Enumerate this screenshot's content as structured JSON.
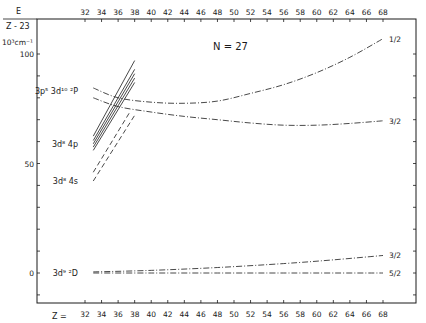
{
  "chart_data": {
    "type": "line",
    "title": "N = 27",
    "ylabel_top": "E",
    "ylabel_bottom": "Z - 23",
    "yunit": "10³cm⁻¹",
    "xlabel": "Z =",
    "xlim": [
      32,
      68
    ],
    "ylim": [
      -13,
      107
    ],
    "x_ticks": [
      32,
      34,
      36,
      38,
      40,
      42,
      44,
      46,
      48,
      50,
      52,
      54,
      56,
      58,
      60,
      62,
      64,
      66,
      68
    ],
    "y_ticks_labeled": [
      0,
      50,
      100
    ],
    "y_minor_step": 10,
    "grid": false,
    "group_labels": [
      {
        "text": "3p⁵ 3d¹⁰ ²P",
        "E": 83
      },
      {
        "text": "3d⁸ 4p",
        "E": 59
      },
      {
        "text": "3d⁸ 4s",
        "E": 42
      },
      {
        "text": "3d⁹ ²D",
        "E": 0
      }
    ],
    "series": [
      {
        "name": "3p5 3d10 2P 1/2",
        "end_label": "1/2",
        "style": "dashdot",
        "x": [
          33,
          36,
          40,
          44,
          48,
          52,
          56,
          60,
          64,
          68
        ],
        "y": [
          84.5,
          80,
          78,
          77.5,
          78.5,
          82,
          86,
          91.5,
          98.5,
          107
        ]
      },
      {
        "name": "3p5 3d10 2P 3/2",
        "end_label": "3/2",
        "style": "dashdot",
        "x": [
          33,
          36,
          40,
          44,
          48,
          52,
          56,
          60,
          64,
          68
        ],
        "y": [
          80,
          76,
          73.5,
          71.5,
          70,
          68.5,
          67.5,
          67.5,
          68.3,
          69.5
        ]
      },
      {
        "name": "3d9 2D 3/2",
        "end_label": "3/2",
        "style": "dashdot",
        "x": [
          33,
          40,
          48,
          56,
          62,
          68
        ],
        "y": [
          0.5,
          1.2,
          2.5,
          4.3,
          6,
          8
        ]
      },
      {
        "name": "3d9 2D 5/2",
        "end_label": "5/2",
        "style": "dashdot",
        "x": [
          33,
          40,
          48,
          56,
          62,
          68
        ],
        "y": [
          0,
          0,
          0,
          0,
          0,
          0
        ]
      },
      {
        "name": "3d8 4p a",
        "style": "solid",
        "x": [
          33,
          38
        ],
        "y": [
          62.5,
          97
        ]
      },
      {
        "name": "3d8 4p b",
        "style": "solid",
        "x": [
          33,
          38
        ],
        "y": [
          60.5,
          93
        ]
      },
      {
        "name": "3d8 4p c",
        "style": "solid",
        "x": [
          33,
          38
        ],
        "y": [
          59,
          91
        ]
      },
      {
        "name": "3d8 4p d",
        "style": "solid",
        "x": [
          33,
          38
        ],
        "y": [
          57.5,
          89
        ]
      },
      {
        "name": "3d8 4p e",
        "style": "solid",
        "x": [
          33,
          38
        ],
        "y": [
          56,
          87
        ]
      },
      {
        "name": "3d8 4s a",
        "style": "dashed",
        "x": [
          33,
          37.5
        ],
        "y": [
          46,
          74
        ]
      },
      {
        "name": "3d8 4s b",
        "style": "dashed",
        "x": [
          33,
          38
        ],
        "y": [
          42,
          72
        ]
      }
    ]
  }
}
